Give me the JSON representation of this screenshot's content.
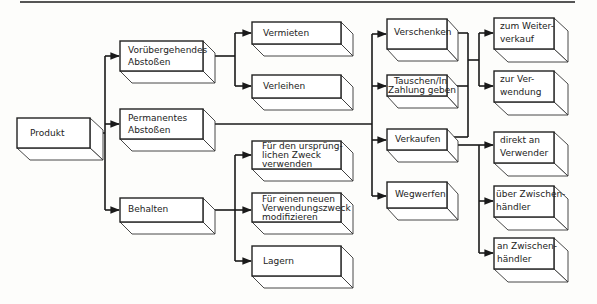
{
  "diagram": {
    "type": "tree",
    "root": "produkt",
    "nodes": [
      {
        "id": "produkt",
        "label": "Produkt",
        "lines": [
          "Produkt"
        ]
      },
      {
        "id": "voruebergehend",
        "label": "Vorübergehendes Abstoßen",
        "lines": [
          "Vorübergehendes",
          "Abstoßen"
        ]
      },
      {
        "id": "permanent",
        "label": "Permanentes Abstoßen",
        "lines": [
          "Permanentes",
          "Abstoßen"
        ]
      },
      {
        "id": "behalten",
        "label": "Behalten",
        "lines": [
          "Behalten"
        ]
      },
      {
        "id": "vermieten",
        "label": "Vermieten",
        "lines": [
          "Vermieten"
        ]
      },
      {
        "id": "verleihen",
        "label": "Verleihen",
        "lines": [
          "Verleihen"
        ]
      },
      {
        "id": "urspruenglich",
        "label": "Für den ursprünglichen Zweck verwenden",
        "lines": [
          "Für den ursprüng-",
          "lichen Zweck",
          "verwenden"
        ]
      },
      {
        "id": "neuerzweck",
        "label": "Für einen neuen Verwendungszweck modifizieren",
        "lines": [
          "Für einen neuen",
          "Verwendungszweck",
          "modifizieren"
        ]
      },
      {
        "id": "lagern",
        "label": "Lagern",
        "lines": [
          "Lagern"
        ]
      },
      {
        "id": "verschenken",
        "label": "Verschenken",
        "lines": [
          "Verschenken"
        ]
      },
      {
        "id": "tauschen",
        "label": "Tauschen/In Zahlung geben",
        "lines": [
          "Tauschen/In",
          "Zahlung geben"
        ]
      },
      {
        "id": "verkaufen",
        "label": "Verkaufen",
        "lines": [
          "Verkaufen"
        ]
      },
      {
        "id": "wegwerfen",
        "label": "Wegwerfen",
        "lines": [
          "Wegwerfen"
        ]
      },
      {
        "id": "weiterverkauf",
        "label": "zum Weiterverkauf",
        "lines": [
          "zum Weiter-",
          "verkauf"
        ]
      },
      {
        "id": "zurverwendung",
        "label": "zur Verwendung",
        "lines": [
          "zur Ver-",
          "wendung"
        ]
      },
      {
        "id": "direkt",
        "label": "direkt an Verwender",
        "lines": [
          "direkt an",
          "Verwender"
        ]
      },
      {
        "id": "ueberzwischen",
        "label": "über Zwischenhändler",
        "lines": [
          "über Zwischen-",
          "händler"
        ]
      },
      {
        "id": "anzwischen",
        "label": "an Zwischenhändler",
        "lines": [
          "an Zwischen-",
          "händler"
        ]
      }
    ],
    "edges": [
      [
        "produkt",
        "voruebergehend"
      ],
      [
        "produkt",
        "permanent"
      ],
      [
        "produkt",
        "behalten"
      ],
      [
        "voruebergehend",
        "vermieten"
      ],
      [
        "voruebergehend",
        "verleihen"
      ],
      [
        "permanent",
        "verschenken"
      ],
      [
        "permanent",
        "tauschen"
      ],
      [
        "permanent",
        "verkaufen"
      ],
      [
        "permanent",
        "wegwerfen"
      ],
      [
        "behalten",
        "urspruenglich"
      ],
      [
        "behalten",
        "neuerzweck"
      ],
      [
        "behalten",
        "lagern"
      ],
      [
        "verschenken",
        "weiterverkauf"
      ],
      [
        "verschenken",
        "zurverwendung"
      ],
      [
        "tauschen",
        "weiterverkauf"
      ],
      [
        "tauschen",
        "zurverwendung"
      ],
      [
        "verkaufen",
        "weiterverkauf"
      ],
      [
        "verkaufen",
        "zurverwendung"
      ],
      [
        "verkaufen",
        "direkt"
      ],
      [
        "verkaufen",
        "ueberzwischen"
      ],
      [
        "verkaufen",
        "anzwischen"
      ]
    ]
  },
  "labels": {
    "produkt": "Produkt",
    "voruebergehend_1": "Vorübergehendes",
    "voruebergehend_2": "Abstoßen",
    "permanent_1": "Permanentes",
    "permanent_2": "Abstoßen",
    "behalten": "Behalten",
    "vermieten": "Vermieten",
    "verleihen": "Verleihen",
    "urspruenglich_1": "Für den ursprüng-",
    "urspruenglich_2": "lichen Zweck",
    "urspruenglich_3": "verwenden",
    "neuerzweck_1": "Für einen neuen",
    "neuerzweck_2": "Verwendungszweck",
    "neuerzweck_3": "modifizieren",
    "lagern": "Lagern",
    "verschenken": "Verschenken",
    "tauschen_1": "Tauschen/In",
    "tauschen_2": "Zahlung geben",
    "verkaufen": "Verkaufen",
    "wegwerfen": "Wegwerfen",
    "weiterverkauf_1": "zum Weiter-",
    "weiterverkauf_2": "verkauf",
    "zurverwendung_1": "zur Ver-",
    "zurverwendung_2": "wendung",
    "direkt_1": "direkt an",
    "direkt_2": "Verwender",
    "ueberzwischen_1": "über Zwischen-",
    "ueberzwischen_2": "händler",
    "anzwischen_1": "an Zwischen-",
    "anzwischen_2": "händler"
  }
}
